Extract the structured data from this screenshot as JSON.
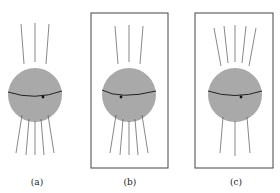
{
  "figure": {
    "panels": [
      {
        "id": "a",
        "label": "(a)",
        "framed": false,
        "lines_above": 3,
        "lines_below": 5,
        "dot_position": "right"
      },
      {
        "id": "b",
        "label": "(b)",
        "framed": true,
        "lines_above": 3,
        "lines_below": 5,
        "dot_position": "left"
      },
      {
        "id": "c",
        "label": "(c)",
        "framed": true,
        "lines_above": 5,
        "lines_below": 3,
        "dot_position": "right"
      }
    ]
  },
  "colors": {
    "sphere_fill": "#a9a9a9",
    "line": "#555555",
    "frame": "#444444",
    "equator": "#222222"
  }
}
